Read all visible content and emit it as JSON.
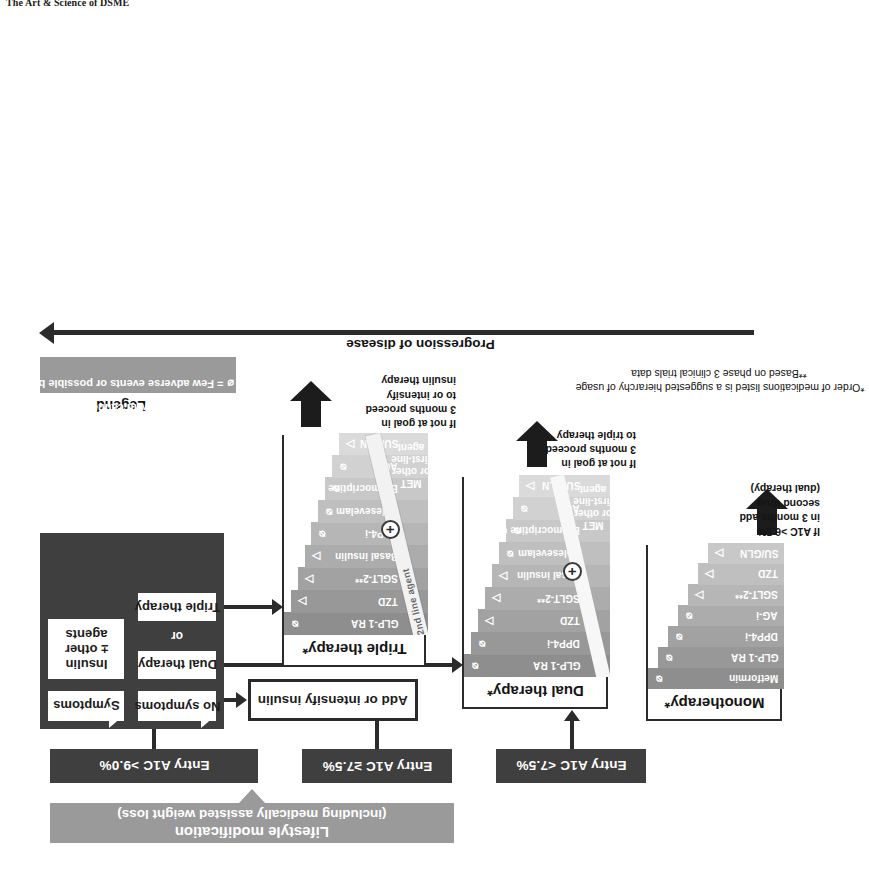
{
  "page": {
    "running_head": "The Art & Science of DSME"
  },
  "lifestyle": {
    "line1": "Lifestyle modification",
    "line2": "(including medically assisted weight loss)"
  },
  "entries": [
    {
      "label": "Entry A1C <7.5%"
    },
    {
      "label": "Entry A1C ≥7.5%"
    },
    {
      "label": "Entry A1C >9.0%"
    }
  ],
  "branch": {
    "no_symptoms": "No symptoms",
    "symptoms": "Symptoms",
    "dual_therapy": "Dual therapy",
    "or": "or",
    "triple_therapy": "Triple therapy",
    "insulin": "Insulin\n± other\nagents",
    "insulin_l1": "Insulin",
    "insulin_l2": "± other",
    "insulin_l3": "agents",
    "add_intensify": "Add or intensify insulin"
  },
  "monotherapy": {
    "title": "Monotherapy*",
    "drugs": [
      {
        "name": "Metformin",
        "symbol": "few"
      },
      {
        "name": "GLP-1 RA",
        "symbol": "few"
      },
      {
        "name": "DPP4-i",
        "symbol": "few"
      },
      {
        "name": "AG-i",
        "symbol": "few"
      },
      {
        "name": "SGLT-2**",
        "symbol": "caution"
      },
      {
        "name": "TZD",
        "symbol": "caution"
      },
      {
        "name": "SU/GLN",
        "symbol": "caution"
      }
    ],
    "note_l1": "If A1C >6.5%",
    "note_l2": "in 3 months add",
    "note_l3": "second drug",
    "note_l4": "(dual therapy)"
  },
  "dual": {
    "title": "Dual therapy*",
    "base_l1": "MET",
    "base_l2": "or other",
    "base_l3": "first-line",
    "base_l4": "agent",
    "plus": "+",
    "drugs": [
      {
        "name": "GLP-1 RA",
        "symbol": "few"
      },
      {
        "name": "DPP4-i",
        "symbol": "few"
      },
      {
        "name": "TZD",
        "symbol": "caution"
      },
      {
        "name": "SGLT-2**",
        "symbol": "caution"
      },
      {
        "name": "Basal insulin",
        "symbol": "caution"
      },
      {
        "name": "Colesevelam",
        "symbol": "few"
      },
      {
        "name": "Bromocriptine QR",
        "symbol": "few"
      },
      {
        "name": "AG-i",
        "symbol": "few"
      },
      {
        "name": "SU/GLN",
        "symbol": "caution"
      }
    ],
    "note_l1": "If not at goal in",
    "note_l2": "3 months proceed",
    "note_l3": "to triple therapy"
  },
  "triple": {
    "title": "Triple therapy*",
    "band_label": "2nd line agent",
    "base_l1": "MET",
    "base_l2": "or other",
    "base_l3": "first-line",
    "base_l4": "agent",
    "plus": "+",
    "drugs": [
      {
        "name": "GLP-1 RA",
        "symbol": "few"
      },
      {
        "name": "TZD",
        "symbol": "caution"
      },
      {
        "name": "SGLT-2**",
        "symbol": "caution"
      },
      {
        "name": "Basal insulin",
        "symbol": "caution"
      },
      {
        "name": "DPP4-i",
        "symbol": "few"
      },
      {
        "name": "Colesevelam",
        "symbol": "few"
      },
      {
        "name": "Bromocriptine QR",
        "symbol": "few"
      },
      {
        "name": "AG-i",
        "symbol": "few"
      },
      {
        "name": "SU/GLN",
        "symbol": "caution"
      }
    ],
    "note_l1": "If not at goal in",
    "note_l2": "3 months proceed",
    "note_l3": "to or intensify",
    "note_l4": "insulin therapy"
  },
  "legend": {
    "title": "Legend",
    "few_symbol": "⌀",
    "few_text": "= Few adverse events or possible benefits",
    "caution_symbol": "△",
    "caution_text": "= Use with caution"
  },
  "progression": {
    "label": "Progression of disease"
  },
  "footnotes": {
    "star": "*Order of medications listed is a suggested hierarchy of usage",
    "doublestar": "**Based on phase 3 clinical trials data"
  },
  "colors": {
    "dark": "#3f3f3f",
    "lifestyle_grey": "#9a9a9a",
    "line": "#2b2b2b",
    "drug_greys": [
      "#8e8e8e",
      "#989898",
      "#a2a2a2",
      "#acacac",
      "#b6b6b6",
      "#bfbfbf",
      "#c8c8c8",
      "#d1d1d1",
      "#dadada"
    ]
  }
}
